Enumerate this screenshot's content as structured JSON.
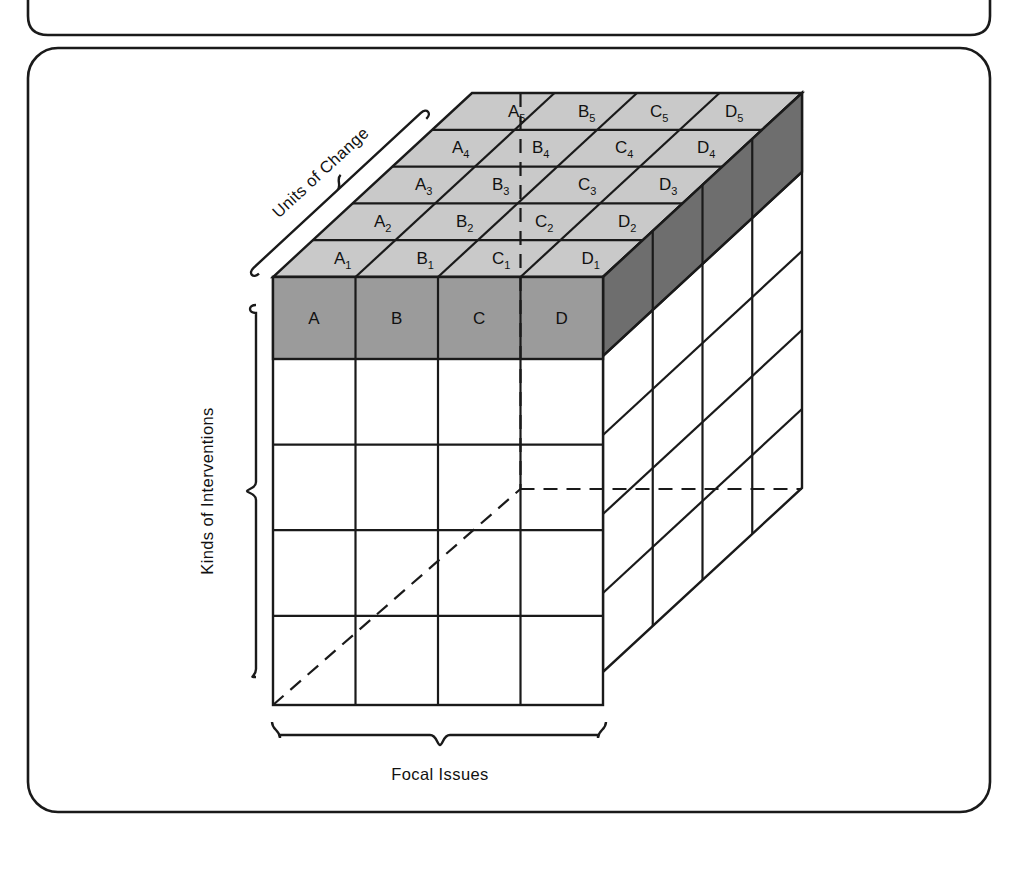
{
  "figure": {
    "title_visible": false,
    "frames": [
      {
        "name": "upper-partial-frame"
      },
      {
        "name": "main-frame"
      }
    ],
    "axes": {
      "depth_axis_label": "Units of Change",
      "vertical_axis_label": "Kinds of Interventions",
      "horizontal_axis_label": "Focal Issues"
    },
    "cube": {
      "columns": [
        "A",
        "B",
        "C",
        "D"
      ],
      "depth_rows": [
        "1",
        "2",
        "3",
        "4",
        "5"
      ],
      "front_rows": 5,
      "side_columns": 4,
      "front_face_labels": [
        "A",
        "B",
        "C",
        "D"
      ],
      "top_face_labels": [
        [
          "A1",
          "B1",
          "C1",
          "D1"
        ],
        [
          "A2",
          "B2",
          "C2",
          "D2"
        ],
        [
          "A3",
          "B3",
          "C3",
          "D3"
        ],
        [
          "A4",
          "B4",
          "C4",
          "D4"
        ],
        [
          "A5",
          "B5",
          "C5",
          "D5"
        ]
      ],
      "top_face_label_parts": [
        [
          {
            "base": "A",
            "sub": "1"
          },
          {
            "base": "B",
            "sub": "1"
          },
          {
            "base": "C",
            "sub": "1"
          },
          {
            "base": "D",
            "sub": "1"
          }
        ],
        [
          {
            "base": "A",
            "sub": "2"
          },
          {
            "base": "B",
            "sub": "2"
          },
          {
            "base": "C",
            "sub": "2"
          },
          {
            "base": "D",
            "sub": "2"
          }
        ],
        [
          {
            "base": "A",
            "sub": "3"
          },
          {
            "base": "B",
            "sub": "3"
          },
          {
            "base": "C",
            "sub": "3"
          },
          {
            "base": "D",
            "sub": "3"
          }
        ],
        [
          {
            "base": "A",
            "sub": "4"
          },
          {
            "base": "B",
            "sub": "4"
          },
          {
            "base": "C",
            "sub": "4"
          },
          {
            "base": "D",
            "sub": "4"
          }
        ],
        [
          {
            "base": "A",
            "sub": "5"
          },
          {
            "base": "B",
            "sub": "5"
          },
          {
            "base": "C",
            "sub": "5"
          },
          {
            "base": "D",
            "sub": "5"
          }
        ]
      ]
    },
    "colors": {
      "top_face_fill": "#c9c9c9",
      "front_highlight_fill": "#9b9b9b",
      "side_highlight_fill": "#6e6e6e",
      "stroke": "#1a1a1a",
      "background": "#ffffff",
      "text": "#111111"
    }
  },
  "labels": {
    "A": "A",
    "B": "B",
    "C": "C",
    "D": "D",
    "A1": "A",
    "A1s": "1",
    "B1": "B",
    "B1s": "1",
    "C1": "C",
    "C1s": "1",
    "D1": "D",
    "D1s": "1",
    "A2": "A",
    "A2s": "2",
    "B2": "B",
    "B2s": "2",
    "C2": "C",
    "C2s": "2",
    "D2": "D",
    "D2s": "2",
    "A3": "A",
    "A3s": "3",
    "B3": "B",
    "B3s": "3",
    "C3": "C",
    "C3s": "3",
    "D3": "D",
    "D3s": "3",
    "A4": "A",
    "A4s": "4",
    "B4": "B",
    "B4s": "4",
    "C4": "C",
    "C4s": "4",
    "D4": "D",
    "D4s": "4",
    "A5": "A",
    "A5s": "5",
    "B5": "B",
    "B5s": "5",
    "C5": "C",
    "C5s": "5",
    "D5": "D",
    "D5s": "5",
    "units_of_change": "Units of Change",
    "kinds_of_interventions": "Kinds of Interventions",
    "focal_issues": "Focal Issues"
  }
}
